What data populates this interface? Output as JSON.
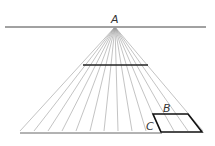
{
  "diagram": {
    "labels": {
      "a": "A",
      "b": "B",
      "c": "C"
    },
    "vanishing_point": [
      115,
      27
    ],
    "horizon": {
      "x1": 5,
      "x2": 206,
      "y": 27
    },
    "ground_line": {
      "x1": 20,
      "x2": 162,
      "y": 133
    },
    "mid_line": {
      "x1": 83,
      "x2": 148,
      "y": 65
    },
    "ray_ends_x": [
      20,
      34,
      48,
      62,
      76,
      90,
      104,
      118,
      132,
      146,
      160,
      174,
      188,
      203
    ],
    "ray_end_y": 131,
    "parallelogram": [
      [
        153,
        114
      ],
      [
        188,
        114
      ],
      [
        202,
        132
      ],
      [
        161,
        132
      ]
    ],
    "colors": {
      "line": "#222222",
      "ray": "#9a9a9a",
      "horizon": "#444444"
    }
  }
}
